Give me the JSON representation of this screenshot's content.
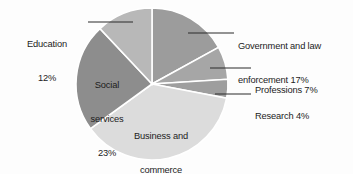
{
  "chart_data": {
    "type": "pie",
    "title": "",
    "subtitle": "",
    "xlabel": "",
    "ylabel": "",
    "legend_position": "none",
    "grid": false,
    "start_angle_deg": 0,
    "direction": "clockwise",
    "categories": [
      "Government and law enforcement",
      "Professions",
      "Research",
      "Business and commerce",
      "Social services",
      "Education"
    ],
    "values": [
      17,
      7,
      4,
      37,
      23,
      12
    ],
    "value_unit": "%",
    "slices": [
      {
        "name": "Government and law enforcement",
        "value": 17,
        "label_text": "Government and law",
        "label_text_2": "enforcement 17%",
        "percent_text": "17%",
        "color": "#9c9c9c",
        "label_placement": "outside-right",
        "leader_line": true
      },
      {
        "name": "Professions",
        "value": 7,
        "label_text": "Professions 7%",
        "percent_text": "7%",
        "color": "#a6a6a6",
        "label_placement": "outside-right",
        "leader_line": true
      },
      {
        "name": "Research",
        "value": 4,
        "label_text": "Research 4%",
        "percent_text": "4%",
        "color": "#9e9e9e",
        "label_placement": "outside-right",
        "leader_line": true
      },
      {
        "name": "Business and commerce",
        "value": 37,
        "label_text": "Business and",
        "label_text_2": "commerce",
        "percent_text": "37%",
        "color": "#dcdcdc",
        "label_placement": "inside",
        "leader_line": false
      },
      {
        "name": "Social services",
        "value": 23,
        "label_text": "Social",
        "label_text_2": "services",
        "percent_text": "23%",
        "color": "#8d8d8d",
        "label_placement": "inside",
        "leader_line": false
      },
      {
        "name": "Education",
        "value": 12,
        "label_text": "Education",
        "percent_text": "12%",
        "color": "#b8b8b8",
        "label_placement": "outside-left",
        "leader_line": true
      }
    ],
    "colors": {
      "background": "#fdfdfd",
      "text": "#1c1c1c",
      "slice_divider": "#ffffff",
      "leader_line": "#2a2a2a"
    }
  },
  "geometry": {
    "center_x": 152,
    "center_y": 84,
    "radius": 76
  }
}
